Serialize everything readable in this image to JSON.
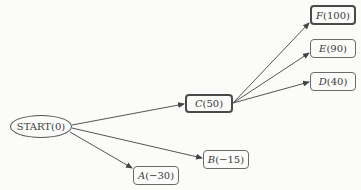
{
  "diagram": {
    "type": "tree",
    "nodes": [
      {
        "id": "start",
        "label": "START",
        "value": "(0)",
        "shape": "ellipse",
        "highlighted": false
      },
      {
        "id": "C",
        "label": "C",
        "value": "(50)",
        "shape": "rounded-rect",
        "highlighted": true
      },
      {
        "id": "F",
        "label": "F",
        "value": "(100)",
        "shape": "rounded-rect",
        "highlighted": true
      },
      {
        "id": "E",
        "label": "E",
        "value": "(90)",
        "shape": "rounded-rect",
        "highlighted": false
      },
      {
        "id": "D",
        "label": "D",
        "value": "(40)",
        "shape": "rounded-rect",
        "highlighted": false
      },
      {
        "id": "B",
        "label": "B",
        "value": "(−15)",
        "shape": "rounded-rect",
        "highlighted": false
      },
      {
        "id": "A",
        "label": "A",
        "value": "(−30)",
        "shape": "rounded-rect",
        "highlighted": false
      }
    ],
    "edges": [
      {
        "from": "START",
        "to": "C"
      },
      {
        "from": "START",
        "to": "B"
      },
      {
        "from": "START",
        "to": "A"
      },
      {
        "from": "C",
        "to": "F"
      },
      {
        "from": "C",
        "to": "E"
      },
      {
        "from": "C",
        "to": "D"
      }
    ]
  }
}
